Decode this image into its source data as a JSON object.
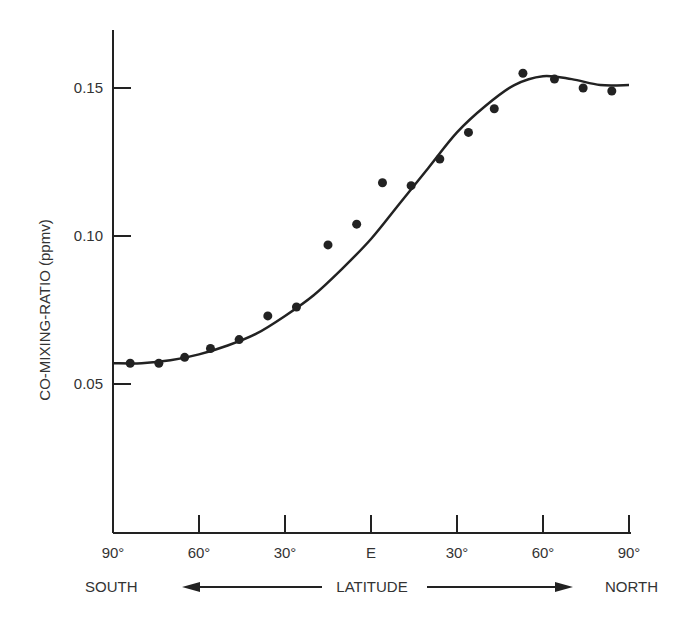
{
  "chart_data": {
    "type": "scatter",
    "title": "",
    "ylabel": "CO-MIXING-RATIO (ppmv)",
    "xlabel": "LATITUDE",
    "x_left_label": "SOUTH",
    "x_right_label": "NORTH",
    "x_ticks": [
      "90°",
      "60°",
      "30°",
      "E",
      "30°",
      "60°",
      "90°"
    ],
    "y_ticks": [
      "0.05",
      "0.10",
      "0.15"
    ],
    "ylim": [
      0.0,
      0.17
    ],
    "xlim": [
      -90,
      90
    ],
    "grid": false,
    "series": [
      {
        "name": "observations",
        "style": "points",
        "x": [
          -84,
          -74,
          -65,
          -56,
          -46,
          -36,
          -26,
          -15,
          -5,
          4,
          14,
          24,
          34,
          43,
          53,
          64,
          74,
          84
        ],
        "values": [
          0.057,
          0.057,
          0.059,
          0.062,
          0.065,
          0.073,
          0.076,
          0.097,
          0.104,
          0.118,
          0.117,
          0.126,
          0.135,
          0.143,
          0.155,
          0.153,
          0.15,
          0.149
        ]
      },
      {
        "name": "fit",
        "style": "line",
        "x": [
          -90,
          -80,
          -70,
          -60,
          -50,
          -40,
          -30,
          -20,
          -10,
          0,
          10,
          20,
          30,
          40,
          50,
          60,
          70,
          80,
          90
        ],
        "values": [
          0.057,
          0.057,
          0.058,
          0.06,
          0.063,
          0.067,
          0.073,
          0.08,
          0.089,
          0.099,
          0.111,
          0.123,
          0.135,
          0.144,
          0.151,
          0.154,
          0.153,
          0.151,
          0.151
        ]
      }
    ]
  }
}
